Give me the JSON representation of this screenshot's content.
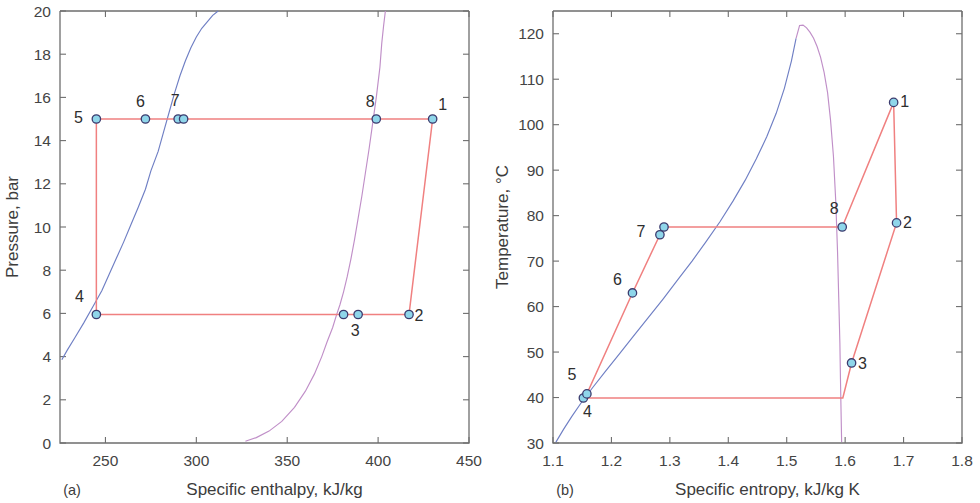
{
  "figure": {
    "background": "#ffffff",
    "marker_fill": "#8fd6ea",
    "marker_edge": "#3b3b6e",
    "cycle_color": "#f08080",
    "sat_liquid_color": "#6f7fc4",
    "sat_vapor_color": "#c08fc8",
    "axis_color": "#6e6e6e"
  },
  "chart_data": [
    {
      "type": "line",
      "panel_tag": "(a)",
      "title": "",
      "xlabel": "Specific enthalpy, kJ/kg",
      "ylabel": "Pressure, bar",
      "xlim": [
        225,
        450
      ],
      "ylim": [
        0,
        20
      ],
      "xticks": [
        250,
        300,
        350,
        400,
        450
      ],
      "yticks": [
        0,
        2,
        4,
        6,
        8,
        10,
        12,
        14,
        16,
        18,
        20
      ],
      "xtick_labels": [
        "250",
        "300",
        "350",
        "400",
        "450"
      ],
      "ytick_labels": [
        "0",
        "2",
        "4",
        "6",
        "8",
        "10",
        "12",
        "14",
        "16",
        "18",
        "20"
      ],
      "grid": false,
      "legend": "none",
      "series": [
        {
          "name": "saturated-liquid-line",
          "color": "#6f7fc4",
          "x": [
            226,
            229,
            233,
            238,
            243,
            248,
            252,
            256,
            260,
            264,
            268,
            272,
            275,
            279,
            282,
            285,
            288,
            291,
            294,
            297,
            300,
            303,
            306,
            309,
            312
          ],
          "y": [
            3.85,
            4.3,
            4.85,
            5.55,
            6.3,
            7.05,
            7.8,
            8.55,
            9.3,
            10.1,
            10.9,
            11.75,
            12.6,
            13.5,
            14.4,
            15.3,
            16.2,
            17.0,
            17.7,
            18.3,
            18.8,
            19.2,
            19.5,
            19.8,
            20.0
          ]
        },
        {
          "name": "saturated-vapor-line",
          "color": "#c08fc8",
          "x": [
            327,
            333,
            340,
            347,
            354,
            360,
            365,
            369,
            372,
            375,
            377,
            379,
            381,
            383,
            385,
            387,
            389,
            391,
            393,
            395,
            397,
            399,
            401,
            402,
            403,
            404
          ],
          "y": [
            0.08,
            0.25,
            0.55,
            1.0,
            1.65,
            2.4,
            3.2,
            4.0,
            4.7,
            5.35,
            5.9,
            6.4,
            7.0,
            7.7,
            8.5,
            9.4,
            10.4,
            11.4,
            12.5,
            13.6,
            14.8,
            16.0,
            17.4,
            18.5,
            19.3,
            20.0
          ]
        },
        {
          "name": "cycle-path",
          "color": "#f08080",
          "x": [
            430,
            417,
            389,
            381,
            245,
            245,
            272,
            290,
            399,
            430
          ],
          "y": [
            15.0,
            5.95,
            5.95,
            5.95,
            5.95,
            15.0,
            15.0,
            15.0,
            15.0,
            15.0
          ]
        }
      ],
      "state_points": [
        {
          "label": "1",
          "x": 430,
          "y": 15.0,
          "label_dx": 10,
          "label_dy": -9
        },
        {
          "label": "2",
          "x": 417,
          "y": 5.95,
          "label_dx": 10,
          "label_dy": 7
        },
        {
          "label": "3",
          "x": 389,
          "y": 5.95,
          "label_dx": -3,
          "label_dy": 22
        },
        {
          "label": "",
          "x": 381,
          "y": 5.95,
          "label_dx": 0,
          "label_dy": 0
        },
        {
          "label": "4",
          "x": 245,
          "y": 5.95,
          "label_dx": -17,
          "label_dy": -12
        },
        {
          "label": "5",
          "x": 245,
          "y": 15.0,
          "label_dx": -18,
          "label_dy": 4
        },
        {
          "label": "6",
          "x": 272,
          "y": 15.0,
          "label_dx": -5,
          "label_dy": -12
        },
        {
          "label": "7",
          "x": 290,
          "y": 15.0,
          "label_dx": -3,
          "label_dy": -13
        },
        {
          "label": "",
          "x": 293,
          "y": 15.0,
          "label_dx": 0,
          "label_dy": 0
        },
        {
          "label": "8",
          "x": 399,
          "y": 15.0,
          "label_dx": -6,
          "label_dy": -12
        }
      ]
    },
    {
      "type": "line",
      "panel_tag": "(b)",
      "title": "",
      "xlabel": "Specific entropy, kJ/kg K",
      "ylabel": "Temperature, °C",
      "xlim": [
        1.1,
        1.8
      ],
      "ylim": [
        30,
        125
      ],
      "xticks": [
        1.1,
        1.2,
        1.3,
        1.4,
        1.5,
        1.6,
        1.7,
        1.8
      ],
      "yticks": [
        30,
        40,
        50,
        60,
        70,
        80,
        90,
        100,
        110,
        120
      ],
      "xtick_labels": [
        "1.1",
        "1.2",
        "1.3",
        "1.4",
        "1.5",
        "1.6",
        "1.7",
        "1.8"
      ],
      "ytick_labels": [
        "30",
        "40",
        "50",
        "60",
        "70",
        "80",
        "90",
        "100",
        "110",
        "120"
      ],
      "grid": false,
      "legend": "none",
      "series": [
        {
          "name": "saturated-liquid-line",
          "color": "#6f7fc4",
          "x": [
            1.105,
            1.118,
            1.132,
            1.148,
            1.168,
            1.19,
            1.213,
            1.237,
            1.262,
            1.288,
            1.313,
            1.338,
            1.362,
            1.386,
            1.408,
            1.429,
            1.448,
            1.466,
            1.482,
            1.496,
            1.508,
            1.516
          ],
          "y": [
            30.2,
            33.0,
            35.8,
            38.8,
            42.2,
            45.8,
            49.5,
            53.4,
            57.4,
            61.6,
            65.8,
            70.0,
            74.3,
            78.7,
            83.2,
            87.8,
            92.5,
            97.4,
            102.5,
            108.0,
            114.0,
            119.0
          ]
        },
        {
          "name": "saturated-vapor-line",
          "color": "#c08fc8",
          "x": [
            1.516,
            1.522,
            1.528,
            1.534,
            1.54,
            1.546,
            1.552,
            1.558,
            1.564,
            1.57,
            1.575,
            1.58,
            1.584,
            1.587,
            1.589,
            1.591,
            1.592,
            1.593,
            1.594
          ],
          "y": [
            119.0,
            121.8,
            121.9,
            121.3,
            120.3,
            119.0,
            117.2,
            114.8,
            111.5,
            107.0,
            101.0,
            93.0,
            83.0,
            72.0,
            62.0,
            52.0,
            44.0,
            37.0,
            30.2
          ]
        },
        {
          "name": "cycle-path",
          "color": "#f08080",
          "x": [
            1.595,
            1.683,
            1.688,
            1.611,
            1.596,
            1.152,
            1.158,
            1.236,
            1.283,
            1.29,
            1.595
          ],
          "y": [
            77.5,
            104.9,
            78.4,
            47.6,
            39.9,
            39.9,
            40.8,
            63.0,
            75.8,
            77.5,
            77.5
          ]
        }
      ],
      "state_points": [
        {
          "label": "1",
          "x": 1.683,
          "y": 104.9,
          "label_dx": 11,
          "label_dy": 5
        },
        {
          "label": "2",
          "x": 1.688,
          "y": 78.4,
          "label_dx": 11,
          "label_dy": 5
        },
        {
          "label": "3",
          "x": 1.611,
          "y": 47.6,
          "label_dx": 11,
          "label_dy": 6
        },
        {
          "label": "4",
          "x": 1.152,
          "y": 39.9,
          "label_dx": 4,
          "label_dy": 19
        },
        {
          "label": "5",
          "x": 1.158,
          "y": 40.8,
          "label_dx": -15,
          "label_dy": -14
        },
        {
          "label": "6",
          "x": 1.236,
          "y": 63.0,
          "label_dx": -15,
          "label_dy": -8
        },
        {
          "label": "7",
          "x": 1.283,
          "y": 75.8,
          "label_dx": -19,
          "label_dy": 2
        },
        {
          "label": "",
          "x": 1.29,
          "y": 77.5,
          "label_dx": 0,
          "label_dy": 0
        },
        {
          "label": "8",
          "x": 1.595,
          "y": 77.5,
          "label_dx": -8,
          "label_dy": -13
        }
      ]
    }
  ]
}
